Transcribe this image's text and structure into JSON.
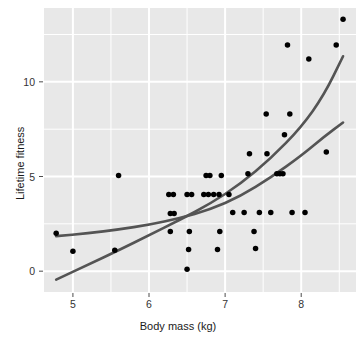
{
  "chart_data": {
    "type": "scatter",
    "title": "",
    "xlabel": "Body mass (kg)",
    "ylabel": "Lifetime fitness",
    "xlim": [
      4.62,
      8.72
    ],
    "ylim": [
      -1.1,
      13.9
    ],
    "xticks": [
      5,
      6,
      7,
      8
    ],
    "xticklabels": [
      "5",
      "6",
      "7",
      "8"
    ],
    "yticks": [
      0,
      5,
      10
    ],
    "yticklabels": [
      "0",
      "5",
      "10"
    ],
    "grid": true,
    "grid_color": "#ffffff",
    "panel_background": "#e8e8e8",
    "point_color": "#000000",
    "point_size": 4.4,
    "legend": "none",
    "points": [
      {
        "x": 4.78,
        "y": 2.0
      },
      {
        "x": 5.0,
        "y": 1.05
      },
      {
        "x": 5.55,
        "y": 1.1
      },
      {
        "x": 5.6,
        "y": 5.05
      },
      {
        "x": 6.26,
        "y": 4.05
      },
      {
        "x": 6.32,
        "y": 4.05
      },
      {
        "x": 6.28,
        "y": 3.05
      },
      {
        "x": 6.33,
        "y": 3.05
      },
      {
        "x": 6.28,
        "y": 2.1
      },
      {
        "x": 6.5,
        "y": 4.05
      },
      {
        "x": 6.56,
        "y": 4.05
      },
      {
        "x": 6.53,
        "y": 2.1
      },
      {
        "x": 6.52,
        "y": 1.15
      },
      {
        "x": 6.5,
        "y": 0.1
      },
      {
        "x": 6.75,
        "y": 5.05
      },
      {
        "x": 6.8,
        "y": 5.05
      },
      {
        "x": 6.72,
        "y": 4.05
      },
      {
        "x": 6.78,
        "y": 4.05
      },
      {
        "x": 6.85,
        "y": 4.05
      },
      {
        "x": 6.92,
        "y": 4.05
      },
      {
        "x": 6.95,
        "y": 5.05
      },
      {
        "x": 6.93,
        "y": 2.1
      },
      {
        "x": 6.9,
        "y": 1.15
      },
      {
        "x": 7.05,
        "y": 4.05
      },
      {
        "x": 7.1,
        "y": 3.1
      },
      {
        "x": 7.25,
        "y": 3.1
      },
      {
        "x": 7.3,
        "y": 5.15
      },
      {
        "x": 7.32,
        "y": 6.2
      },
      {
        "x": 7.38,
        "y": 2.1
      },
      {
        "x": 7.4,
        "y": 1.2
      },
      {
        "x": 7.45,
        "y": 3.1
      },
      {
        "x": 7.54,
        "y": 8.3
      },
      {
        "x": 7.55,
        "y": 6.2
      },
      {
        "x": 7.6,
        "y": 3.1
      },
      {
        "x": 7.68,
        "y": 5.15
      },
      {
        "x": 7.72,
        "y": 5.15
      },
      {
        "x": 7.76,
        "y": 5.15
      },
      {
        "x": 7.78,
        "y": 7.2
      },
      {
        "x": 7.85,
        "y": 8.3
      },
      {
        "x": 7.82,
        "y": 11.95
      },
      {
        "x": 7.88,
        "y": 3.1
      },
      {
        "x": 8.05,
        "y": 3.1
      },
      {
        "x": 8.1,
        "y": 11.2
      },
      {
        "x": 8.33,
        "y": 6.3
      },
      {
        "x": 8.46,
        "y": 11.95
      },
      {
        "x": 8.55,
        "y": 13.3
      }
    ],
    "fitted_curves": [
      {
        "name": "linear-fit",
        "color": "#545454",
        "width": 2.6,
        "points": [
          {
            "x": 4.78,
            "y": -0.45
          },
          {
            "x": 5.2,
            "y": 0.35
          },
          {
            "x": 5.6,
            "y": 1.1
          },
          {
            "x": 6.0,
            "y": 1.9
          },
          {
            "x": 6.4,
            "y": 2.7
          },
          {
            "x": 6.8,
            "y": 3.55
          },
          {
            "x": 7.2,
            "y": 4.6
          },
          {
            "x": 7.6,
            "y": 5.95
          },
          {
            "x": 8.0,
            "y": 7.6
          },
          {
            "x": 8.3,
            "y": 9.3
          },
          {
            "x": 8.55,
            "y": 11.35
          }
        ]
      },
      {
        "name": "loess-fit",
        "color": "#545454",
        "width": 2.6,
        "points": [
          {
            "x": 4.78,
            "y": 1.85
          },
          {
            "x": 5.2,
            "y": 2.0
          },
          {
            "x": 5.6,
            "y": 2.2
          },
          {
            "x": 6.0,
            "y": 2.45
          },
          {
            "x": 6.4,
            "y": 2.8
          },
          {
            "x": 6.8,
            "y": 3.25
          },
          {
            "x": 7.2,
            "y": 3.95
          },
          {
            "x": 7.6,
            "y": 4.95
          },
          {
            "x": 8.0,
            "y": 6.1
          },
          {
            "x": 8.3,
            "y": 7.1
          },
          {
            "x": 8.55,
            "y": 7.85
          }
        ]
      }
    ]
  },
  "axes": {
    "xlabel": "Body mass (kg)",
    "ylabel": "Lifetime fitness"
  }
}
